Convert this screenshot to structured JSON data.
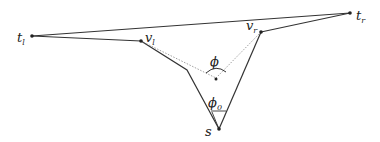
{
  "diagram": {
    "labels": {
      "t_l": {
        "base": "t",
        "sub": "l"
      },
      "t_r": {
        "base": "t",
        "sub": "r"
      },
      "v_l": {
        "base": "v",
        "sub": "l"
      },
      "v_r": {
        "base": "v",
        "sub": "r"
      },
      "s": {
        "base": "s",
        "sub": ""
      },
      "phi": {
        "base": "ϕ",
        "sub": ""
      },
      "phi_0": {
        "base": "ϕ",
        "sub": "0"
      }
    },
    "edges": [
      {
        "from": "t_l",
        "to": "t_r",
        "style": "solid"
      },
      {
        "from": "t_l",
        "to": "v_l",
        "style": "solid"
      },
      {
        "from": "v_l",
        "to": "bend_l",
        "style": "solid"
      },
      {
        "from": "bend_l",
        "to": "s",
        "style": "solid"
      },
      {
        "from": "v_r",
        "to": "t_r",
        "style": "solid"
      },
      {
        "from": "v_r",
        "to": "s",
        "style": "solid"
      },
      {
        "from": "v_l",
        "to": "center",
        "style": "dotted"
      },
      {
        "from": "v_r",
        "to": "center",
        "style": "dotted"
      }
    ],
    "colors": {
      "stroke": "#333333",
      "dotted": "#888888"
    }
  }
}
